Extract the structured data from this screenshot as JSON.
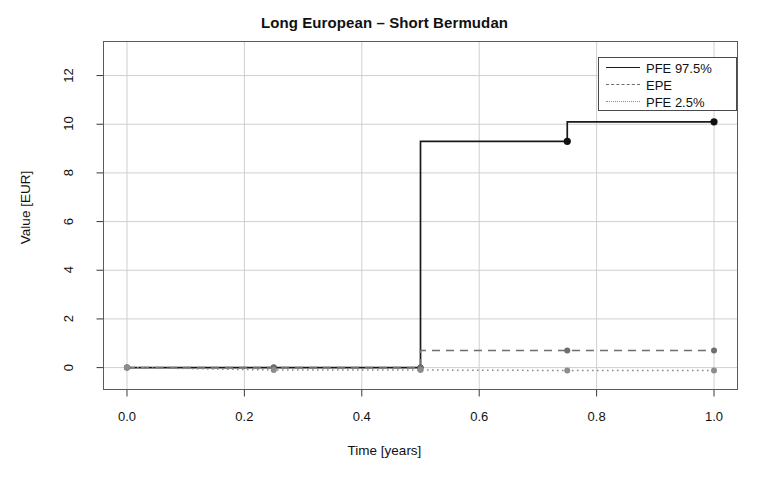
{
  "chart_data": {
    "type": "line",
    "title": "Long European – Short Bermudan",
    "xlabel": "Time [years]",
    "ylabel": "Value [EUR]",
    "xlim": [
      -0.04,
      1.04
    ],
    "ylim": [
      -0.9,
      13.4
    ],
    "grid": true,
    "legend_position": "top-right",
    "xticks": [
      "0.0",
      "0.2",
      "0.4",
      "0.6",
      "0.8",
      "1.0"
    ],
    "xtick_values": [
      0.0,
      0.2,
      0.4,
      0.6,
      0.8,
      1.0
    ],
    "yticks": [
      "0",
      "2",
      "4",
      "6",
      "8",
      "10",
      "12"
    ],
    "ytick_values": [
      0,
      2,
      4,
      6,
      8,
      10,
      12
    ],
    "x": [
      0.0,
      0.25,
      0.5,
      0.75,
      1.0
    ],
    "series": [
      {
        "name": "PFE 97.5%",
        "style": "solid",
        "color": "#1a1a1a",
        "values": [
          0.0,
          0.0,
          0.0,
          9.3,
          10.1
        ],
        "markers": true
      },
      {
        "name": "EPE",
        "style": "dashed",
        "color": "#6e6e6e",
        "values": [
          0.0,
          0.0,
          0.0,
          0.7,
          0.7
        ],
        "markers": true
      },
      {
        "name": "PFE 2.5%",
        "style": "dotted",
        "color": "#8c8c8c",
        "values": [
          0.0,
          -0.1,
          -0.1,
          -0.12,
          -0.12
        ],
        "markers": true
      }
    ]
  },
  "legend": {
    "items": [
      {
        "label": "PFE 97.5%"
      },
      {
        "label": "EPE"
      },
      {
        "label": "PFE 2.5%"
      }
    ]
  },
  "axes": {
    "x_title": "Time [years]",
    "y_title": "Value [EUR]"
  }
}
